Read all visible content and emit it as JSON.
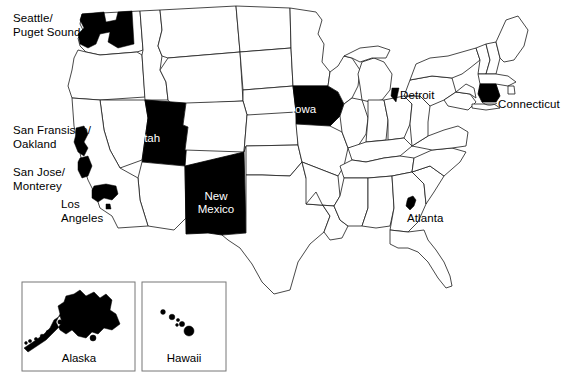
{
  "figure": {
    "type": "choropleth-map",
    "region": "United States",
    "width": 575,
    "height": 389,
    "background_color": "#ffffff",
    "outline_color": "#1a1a1a",
    "highlight_color": "#000000",
    "highlight_text_color": "#ffffff",
    "label_text_color": "#000000"
  },
  "highlighted_states": [
    {
      "id": "utah",
      "label": "Utah",
      "label_x": 148,
      "label_y": 139,
      "label_color": "#ffffff"
    },
    {
      "id": "new-mexico",
      "label": "New\nMexico",
      "label_x": 191,
      "label_y": 196,
      "label_color": "#ffffff"
    },
    {
      "id": "iowa",
      "label": "Iowa",
      "label_x": 304,
      "label_y": 110,
      "label_color": "#ffffff"
    }
  ],
  "metro_labels": [
    {
      "id": "seattle-puget-sound",
      "label": "Seattle/\nPuget Sound",
      "x": 13,
      "y": 12,
      "align": "left"
    },
    {
      "id": "san-francisco-oakland",
      "label": "San Fransisco/\nOakland",
      "x": 13,
      "y": 124,
      "align": "left"
    },
    {
      "id": "san-jose-monterey",
      "label": "San Jose/\nMonterey",
      "x": 13,
      "y": 166,
      "align": "left"
    },
    {
      "id": "los-angeles",
      "label": "Los\nAngeles",
      "x": 61,
      "y": 198,
      "align": "left"
    },
    {
      "id": "detroit",
      "label": "Detroit",
      "x": 400,
      "y": 89,
      "align": "left"
    },
    {
      "id": "connecticut",
      "label": "Connecticut",
      "x": 498,
      "y": 98,
      "align": "left"
    },
    {
      "id": "atlanta",
      "label": "Atlanta",
      "x": 407,
      "y": 212,
      "align": "left"
    }
  ],
  "insets": [
    {
      "id": "alaska",
      "label": "Alaska",
      "box_x": 22,
      "box_y": 282,
      "box_w": 113,
      "box_h": 89,
      "label_x": 22,
      "label_y": 352
    },
    {
      "id": "hawaii",
      "label": "Hawaii",
      "box_x": 142,
      "box_y": 282,
      "box_w": 84,
      "box_h": 89,
      "label_x": 130,
      "label_y": 352
    }
  ]
}
